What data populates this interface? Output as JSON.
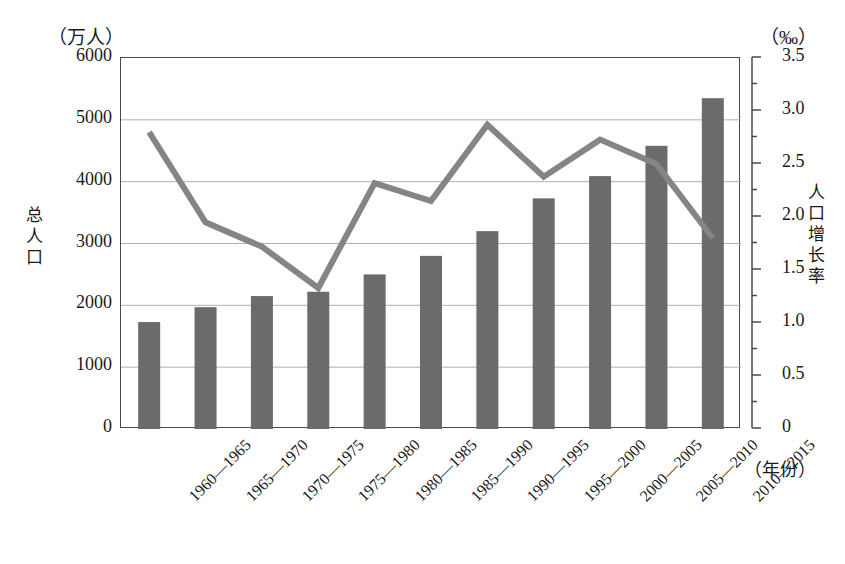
{
  "axes": {
    "left_unit": "（万人）",
    "right_unit": "（‰）",
    "left_title": "总人口",
    "right_title": "人口增长率",
    "x_unit": "（年份）"
  },
  "chart_data": {
    "type": "bar",
    "title": "",
    "subtitle": "",
    "xlabel": "（年份）",
    "ylabel": "总人口（万人）",
    "y2label": "人口增长率（‰）",
    "grid": true,
    "legend_position": "none",
    "categories": [
      "1960—1965",
      "1965—1970",
      "1970—1975",
      "1975—1980",
      "1980—1985",
      "1985—1990",
      "1990—1995",
      "1995—2000",
      "2000—2005",
      "2005—2010",
      "2010—2015"
    ],
    "ylim": [
      0,
      6000
    ],
    "yticks": [
      0,
      1000,
      2000,
      3000,
      4000,
      5000,
      6000
    ],
    "ytick_labels": [
      "0",
      "1000",
      "2000",
      "3000",
      "4000",
      "5000",
      "6000"
    ],
    "y2lim": [
      0,
      3.5
    ],
    "y2ticks": [
      0,
      0.5,
      1.0,
      1.5,
      2.0,
      2.5,
      3.0,
      3.5
    ],
    "y2tick_labels": [
      "0",
      "0.5",
      "1.0",
      "1.5",
      "2.0",
      "2.5",
      "3.0",
      "3.5"
    ],
    "y2_minor_tick_step": 0.25,
    "series": [
      {
        "name": "总人口",
        "type": "bar",
        "axis": "left",
        "unit": "万人",
        "color": "#6b6b6b",
        "values": [
          1730,
          1970,
          2150,
          2220,
          2500,
          2800,
          3200,
          3730,
          4090,
          4580,
          5350
        ]
      },
      {
        "name": "人口增长率",
        "type": "line",
        "axis": "right",
        "unit": "‰",
        "color": "#858585",
        "values": [
          2.8,
          1.95,
          1.72,
          1.33,
          2.32,
          2.15,
          2.87,
          2.38,
          2.73,
          2.5,
          1.8
        ]
      }
    ]
  }
}
